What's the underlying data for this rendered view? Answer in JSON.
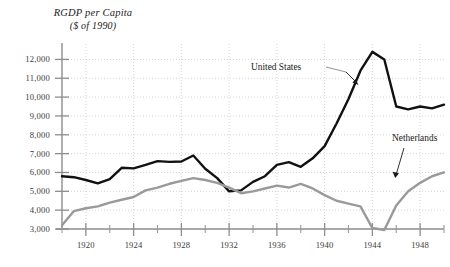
{
  "figure": {
    "title_line1": "RGDP per Capita",
    "title_line2": "($ of 1990)"
  },
  "annotations": {
    "us_label": "United States",
    "nl_label": "Netherlands"
  },
  "chart_data": {
    "type": "line",
    "title": "RGDP per Capita",
    "subtitle": "($ of 1990)",
    "xlabel": "",
    "ylabel": "RGDP per Capita ($ of 1990)",
    "xlim": [
      1918,
      1950
    ],
    "ylim": [
      3000,
      12500
    ],
    "yticks": [
      3000,
      4000,
      5000,
      6000,
      7000,
      8000,
      9000,
      10000,
      11000,
      12000
    ],
    "ytick_labels": [
      "3,000",
      "4,000",
      "5,000",
      "6,000",
      "7,000",
      "8,000",
      "9,000",
      "10,000",
      "11,000",
      "12,000"
    ],
    "xticks": [
      1920,
      1924,
      1928,
      1932,
      1936,
      1940,
      1944,
      1948
    ],
    "xtick_labels": [
      "1920",
      "1924",
      "1928",
      "1932",
      "1936",
      "1940",
      "1944",
      "1948"
    ],
    "xticks_minor": [
      1918,
      1922,
      1926,
      1930,
      1934,
      1938,
      1942,
      1946,
      1950
    ],
    "grid": true,
    "grid_style": "dotted",
    "legend": "annotations",
    "x": [
      1918,
      1919,
      1920,
      1921,
      1922,
      1923,
      1924,
      1925,
      1926,
      1927,
      1928,
      1929,
      1930,
      1931,
      1932,
      1933,
      1934,
      1935,
      1936,
      1937,
      1938,
      1939,
      1940,
      1941,
      1942,
      1943,
      1944,
      1945,
      1946,
      1947,
      1948,
      1949,
      1950
    ],
    "series": [
      {
        "name": "United States",
        "color": "#111111",
        "values": [
          5800,
          5750,
          5600,
          5420,
          5650,
          6250,
          6220,
          6400,
          6600,
          6560,
          6580,
          6900,
          6200,
          5700,
          5000,
          5050,
          5500,
          5800,
          6400,
          6550,
          6300,
          6750,
          7400,
          8600,
          9900,
          11400,
          12400,
          12000,
          9500,
          9350,
          9500,
          9400,
          9600
        ],
        "linewidth": 2.4
      },
      {
        "name": "Netherlands",
        "color": "#9a9a9a",
        "values": [
          3200,
          3950,
          4100,
          4200,
          4400,
          4550,
          4700,
          5050,
          5200,
          5400,
          5550,
          5700,
          5600,
          5450,
          5200,
          4900,
          5000,
          5150,
          5300,
          5200,
          5400,
          5150,
          4800,
          4500,
          4350,
          4200,
          3050,
          2950,
          4250,
          5000,
          5450,
          5800,
          6000
        ],
        "linewidth": 2.4
      }
    ]
  }
}
